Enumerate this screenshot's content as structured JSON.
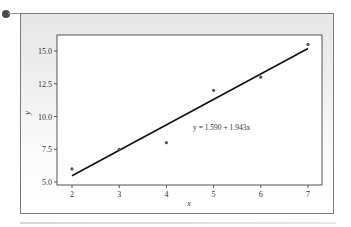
{
  "chart_data": {
    "type": "scatter",
    "title": "",
    "xlabel": "x",
    "ylabel": "y",
    "x": [
      2,
      3,
      4,
      5,
      6,
      7
    ],
    "series": [
      {
        "name": "observed",
        "values": [
          6.0,
          7.5,
          8.0,
          12.0,
          13.0,
          15.5
        ]
      },
      {
        "name": "fitted line",
        "type": "line",
        "intercept": 1.59,
        "slope": 1.943
      }
    ],
    "xticks": [
      "2",
      "3",
      "4",
      "5",
      "6",
      "7"
    ],
    "yticks": [
      "5.0",
      "7.5",
      "10.0",
      "12.5",
      "15.0"
    ],
    "xlim": [
      1.9,
      7.1
    ],
    "ylim": [
      4.8,
      16.2
    ],
    "annotation": "y = 1.590 + 1.943x",
    "grid": false,
    "legend": "none"
  },
  "colors": {
    "frame_border": "#7a7a7a",
    "plot_border": "#555555",
    "points": "#555555",
    "line": "#111111"
  }
}
